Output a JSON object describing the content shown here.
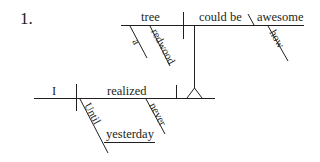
{
  "problem_number": "1.",
  "diagram": {
    "type": "sentence-diagram",
    "sentence_parts": {
      "main_clause": {
        "subject": "I",
        "verb": "realized",
        "modifiers": [
          {
            "word": "Until",
            "type": "preposition",
            "object": "yesterday"
          },
          {
            "word": "never",
            "type": "adverb"
          }
        ]
      },
      "noun_clause": {
        "subject": "tree",
        "verb": "could be",
        "complement": "awesome",
        "modifiers": [
          {
            "word": "a",
            "modifies": "tree"
          },
          {
            "word": "redwood",
            "modifies": "tree"
          },
          {
            "word": "how",
            "modifies": "awesome"
          }
        ]
      }
    },
    "words": {
      "tree": "tree",
      "could_be": "could be",
      "awesome": "awesome",
      "a": "a",
      "redwood": "redwood",
      "how": "how",
      "I": "I",
      "realized": "realized",
      "until": "Until",
      "yesterday": "yesterday",
      "never": "never"
    },
    "line_color": "#231f20"
  }
}
